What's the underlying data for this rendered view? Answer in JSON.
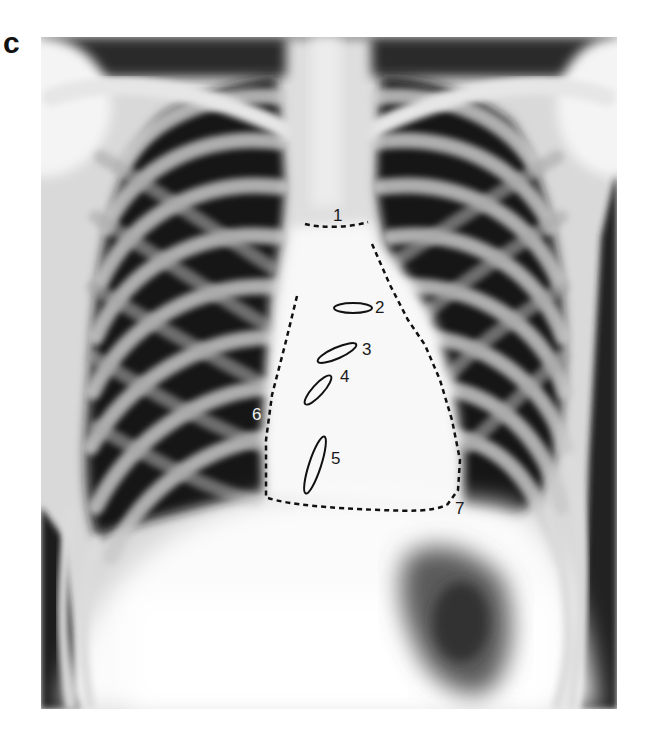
{
  "figure": {
    "panel_label": "c",
    "image_type": "chest-xray-pa",
    "colors": {
      "background": "#ffffff",
      "lung_dark": "#151515",
      "bone_light": "#e8e8e8",
      "mediastinum": "#fafafa",
      "annotation_stroke": "#111111",
      "annotation_light_text": "#f2f2f2"
    }
  },
  "annotations": [
    {
      "id": 1,
      "label": "1",
      "kind": "dashed-line",
      "x": 338,
      "y": 216,
      "text_color": "dark"
    },
    {
      "id": 2,
      "label": "2",
      "kind": "ellipse",
      "x": 358,
      "y": 301,
      "text_color": "dark"
    },
    {
      "id": 3,
      "label": "3",
      "kind": "ellipse",
      "x": 362,
      "y": 343,
      "text_color": "dark"
    },
    {
      "id": 4,
      "label": "4",
      "kind": "ellipse",
      "x": 340,
      "y": 370,
      "text_color": "dark"
    },
    {
      "id": 5,
      "label": "5",
      "kind": "ellipse",
      "x": 331,
      "y": 452,
      "text_color": "dark"
    },
    {
      "id": 6,
      "label": "6",
      "kind": "dashed-outline",
      "x": 252,
      "y": 408,
      "text_color": "light"
    },
    {
      "id": 7,
      "label": "7",
      "kind": "dashed-outline",
      "x": 454,
      "y": 500,
      "text_color": "dark"
    }
  ]
}
